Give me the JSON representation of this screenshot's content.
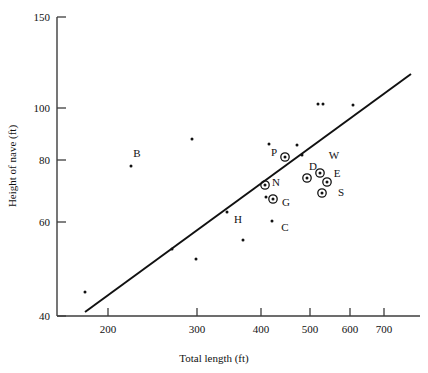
{
  "chart_data": {
    "type": "scatter",
    "title": "",
    "xlabel": "Total length (ft)",
    "ylabel": "Height of nave (ft)",
    "xticks": [
      200,
      300,
      400,
      500,
      600,
      700
    ],
    "yticks": [
      40,
      60,
      80,
      100,
      150
    ],
    "xlim": [
      170,
      760
    ],
    "ylim": [
      40,
      155
    ],
    "grid": false,
    "legend": "none",
    "axis_scale": "nonlinear-compressed",
    "series": [
      {
        "name": "labelled cathedrals",
        "marker": "bullseye",
        "points": [
          {
            "label": "P",
            "x": 441,
            "y": 81,
            "px": 285,
            "py": 157,
            "lx": 274,
            "ly": 156
          },
          {
            "label": "N",
            "x": 407,
            "y": 72,
            "px": 265,
            "py": 185,
            "lx": 276,
            "ly": 186
          },
          {
            "label": "G",
            "x": 425,
            "y": 68,
            "px": 273,
            "py": 199,
            "lx": 286,
            "ly": 206
          },
          {
            "label": "D",
            "x": 510,
            "y": 73,
            "px": 307,
            "py": 178,
            "lx": 313,
            "ly": 170
          },
          {
            "label": "W",
            "x": 531,
            "y": 78,
            "px": 320,
            "py": 173,
            "lx": 334,
            "ly": 159
          },
          {
            "label": "E",
            "x": 546,
            "y": 71,
            "px": 327,
            "py": 182,
            "lx": 337,
            "ly": 177
          },
          {
            "label": "S",
            "x": 535,
            "y": 67,
            "px": 322,
            "py": 193,
            "lx": 341,
            "ly": 196
          }
        ]
      },
      {
        "name": "labelled plain points",
        "marker": "dot",
        "points": [
          {
            "label": "B",
            "x": 230,
            "y": 79,
            "px": 131,
            "py": 166,
            "lx": 137,
            "ly": 157
          },
          {
            "label": "H",
            "x": 380,
            "y": 63,
            "px": 227,
            "py": 212,
            "lx": 238,
            "ly": 223
          },
          {
            "label": "C",
            "x": 430,
            "y": 61,
            "px": 272,
            "py": 221,
            "lx": 285,
            "ly": 231
          }
        ]
      },
      {
        "name": "unlabelled points",
        "marker": "dot",
        "points": [
          {
            "x": 175,
            "y": 45,
            "px": 85,
            "py": 292
          },
          {
            "x": 277,
            "y": 55,
            "px": 172,
            "py": 249
          },
          {
            "x": 300,
            "y": 88,
            "px": 192,
            "py": 139
          },
          {
            "x": 312,
            "y": 52,
            "px": 196,
            "py": 259
          },
          {
            "x": 362,
            "y": 57,
            "px": 243,
            "py": 240
          },
          {
            "x": 417,
            "y": 85,
            "px": 269,
            "py": 144
          },
          {
            "x": 420,
            "y": 66,
            "px": 266,
            "py": 197
          },
          {
            "x": 455,
            "y": 84,
            "px": 297,
            "py": 145
          },
          {
            "x": 468,
            "y": 100,
            "px": 318,
            "py": 104
          },
          {
            "x": 483,
            "y": 100,
            "px": 323,
            "py": 104
          },
          {
            "x": 490,
            "y": 82,
            "px": 302,
            "py": 155
          },
          {
            "x": 600,
            "y": 101,
            "px": 353,
            "py": 105
          }
        ]
      }
    ],
    "trendline": {
      "x1": 85,
      "y1": 312,
      "x2": 411,
      "y2": 74,
      "style": "solid"
    }
  },
  "colors": {
    "axis": "#3d3d3d",
    "marker": "#111111",
    "line": "#111111",
    "background": "#ffffff"
  }
}
